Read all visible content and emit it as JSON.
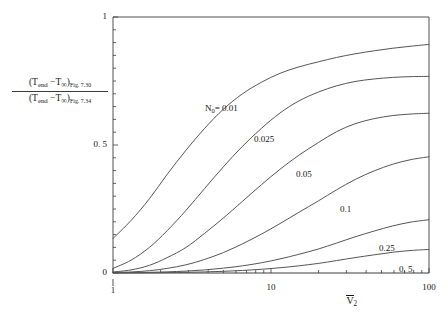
{
  "chart_data": {
    "type": "line",
    "title": "",
    "xlabel": "V̅2",
    "xlabel_parts": {
      "base": "V",
      "subscript": "2",
      "overbar": true
    },
    "ylabel": "(T_end − T_∞)_Fig. 7.30 / (T_end − T_∞)_Fig. 7.34",
    "ylabel_numerator": {
      "open": "(",
      "t1": "T",
      "t1_sub": "end",
      "minus": "−",
      "t2": "T",
      "t2_sub": "∞",
      "close": ")",
      "tag": "Fig. 7.30"
    },
    "ylabel_denominator": {
      "open": "(",
      "t1": "T",
      "t1_sub": "end",
      "minus": "−",
      "t2": "T",
      "t2_sub": "∞",
      "close": ")",
      "tag": "Fig. 7.34"
    },
    "xscale": "log",
    "yscale": "linear",
    "xlim": [
      1,
      100
    ],
    "ylim": [
      0,
      1
    ],
    "grid": false,
    "legend_position": "inline-curve-labels",
    "xticks_major": [
      1,
      10,
      100
    ],
    "xticks_major_labels": [
      "1",
      "10",
      "100"
    ],
    "yticks_major": [
      0,
      0.5,
      1
    ],
    "yticks_major_labels": [
      "0",
      "0. 5",
      "1"
    ],
    "yticks_minor_count_per_half": 10,
    "series_parameter_name": "N₀",
    "series_parameter_label": "N₀= 0.01",
    "series": [
      {
        "name": "0.01",
        "label": "N₀= 0.01",
        "label_is_primary": true,
        "x": [
          1,
          1.3,
          1.7,
          2.2,
          2.9,
          3.8,
          5,
          6.6,
          8.7,
          11.4,
          15,
          20,
          26,
          34,
          45,
          59,
          77,
          100
        ],
        "y": [
          0.135,
          0.205,
          0.29,
          0.385,
          0.48,
          0.565,
          0.64,
          0.7,
          0.745,
          0.78,
          0.805,
          0.825,
          0.842,
          0.856,
          0.868,
          0.878,
          0.886,
          0.893
        ]
      },
      {
        "name": "0.025",
        "label": "0.025",
        "label_is_primary": false,
        "x": [
          1,
          1.3,
          1.7,
          2.2,
          2.9,
          3.8,
          5,
          6.6,
          8.7,
          11.4,
          15,
          20,
          26,
          34,
          45,
          59,
          77,
          100
        ],
        "y": [
          0.018,
          0.05,
          0.1,
          0.165,
          0.245,
          0.33,
          0.415,
          0.495,
          0.565,
          0.625,
          0.672,
          0.707,
          0.731,
          0.748,
          0.758,
          0.764,
          0.767,
          0.768
        ]
      },
      {
        "name": "0.05",
        "label": "0.05",
        "label_is_primary": false,
        "x": [
          1,
          1.3,
          1.7,
          2.2,
          2.9,
          3.8,
          5,
          6.6,
          8.7,
          11.4,
          15,
          20,
          26,
          34,
          45,
          59,
          77,
          100
        ],
        "y": [
          0.004,
          0.012,
          0.03,
          0.06,
          0.1,
          0.155,
          0.215,
          0.28,
          0.345,
          0.405,
          0.46,
          0.51,
          0.552,
          0.583,
          0.603,
          0.615,
          0.621,
          0.624
        ]
      },
      {
        "name": "0.1",
        "label": "0.1",
        "label_is_primary": false,
        "x": [
          1,
          1.3,
          1.7,
          2.2,
          2.9,
          3.8,
          5,
          6.6,
          8.7,
          11.4,
          15,
          20,
          26,
          34,
          45,
          59,
          77,
          100
        ],
        "y": [
          0.002,
          0.004,
          0.009,
          0.018,
          0.032,
          0.053,
          0.08,
          0.114,
          0.152,
          0.193,
          0.237,
          0.282,
          0.325,
          0.365,
          0.399,
          0.425,
          0.443,
          0.454
        ]
      },
      {
        "name": "0.25",
        "label": "0.25",
        "label_is_primary": false,
        "x": [
          1,
          1.3,
          1.7,
          2.2,
          2.9,
          3.8,
          5,
          6.6,
          8.7,
          11.4,
          15,
          20,
          26,
          34,
          45,
          59,
          77,
          100
        ],
        "y": [
          0.0008,
          0.0014,
          0.0026,
          0.0045,
          0.0075,
          0.012,
          0.019,
          0.028,
          0.04,
          0.055,
          0.073,
          0.094,
          0.117,
          0.141,
          0.164,
          0.184,
          0.199,
          0.208
        ]
      },
      {
        "name": "0.5",
        "label": "0. 5",
        "label_is_primary": false,
        "x": [
          1,
          1.3,
          1.7,
          2.2,
          2.9,
          3.8,
          5,
          6.6,
          8.7,
          11.4,
          15,
          20,
          26,
          34,
          45,
          59,
          77,
          100
        ],
        "y": [
          0.0003,
          0.0005,
          0.0009,
          0.0016,
          0.0026,
          0.0042,
          0.0066,
          0.0099,
          0.0145,
          0.0205,
          0.028,
          0.0375,
          0.0485,
          0.06,
          0.071,
          0.081,
          0.088,
          0.092
        ]
      }
    ],
    "curve_label_positions": [
      {
        "series": "0.01",
        "x_px": 205,
        "y_px": 103
      },
      {
        "series": "0.025",
        "x_px": 254,
        "y_px": 134
      },
      {
        "series": "0.05",
        "x_px": 296,
        "y_px": 169
      },
      {
        "series": "0.1",
        "x_px": 340,
        "y_px": 204
      },
      {
        "series": "0.25",
        "x_px": 379,
        "y_px": 243
      },
      {
        "series": "0.5",
        "x_px": 399,
        "y_px": 264
      }
    ],
    "colors": {
      "curve": "#555555",
      "axis": "#3c3c3c",
      "text": "#141414",
      "background": "#ffffff"
    }
  },
  "axes": {
    "frame": {
      "left_px": 113,
      "right_px": 429,
      "top_px": 17,
      "bottom_px": 273
    }
  }
}
